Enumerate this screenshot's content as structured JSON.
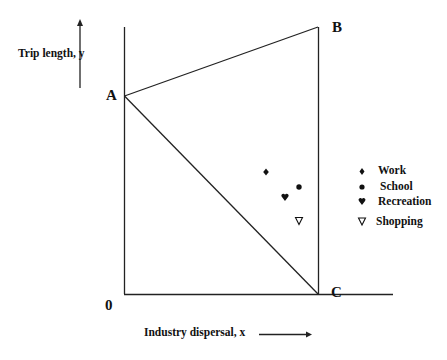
{
  "diagram": {
    "points": {
      "A": "A",
      "B": "B",
      "C": "C",
      "origin": "0"
    },
    "axes": {
      "y_label": "Trip length, y",
      "x_label": "Industry dispersal,  x"
    },
    "legend": [
      {
        "symbol": "♦",
        "label": "Work",
        "icon": "diamond-icon"
      },
      {
        "symbol": "●",
        "label": "School",
        "icon": "circle-icon"
      },
      {
        "symbol": "♥",
        "label": "Recreation",
        "icon": "heart-icon"
      },
      {
        "symbol": "∇",
        "label": "Shopping",
        "icon": "triangle-down-icon"
      }
    ],
    "markers": [
      {
        "category": "Work",
        "x": 266,
        "y": 172
      },
      {
        "category": "School",
        "x": 299,
        "y": 187
      },
      {
        "category": "Recreation",
        "x": 285,
        "y": 197
      },
      {
        "category": "Shopping",
        "x": 299,
        "y": 221
      }
    ],
    "colors": {
      "line": "#222222",
      "text": "#111111",
      "background": "#ffffff"
    }
  }
}
